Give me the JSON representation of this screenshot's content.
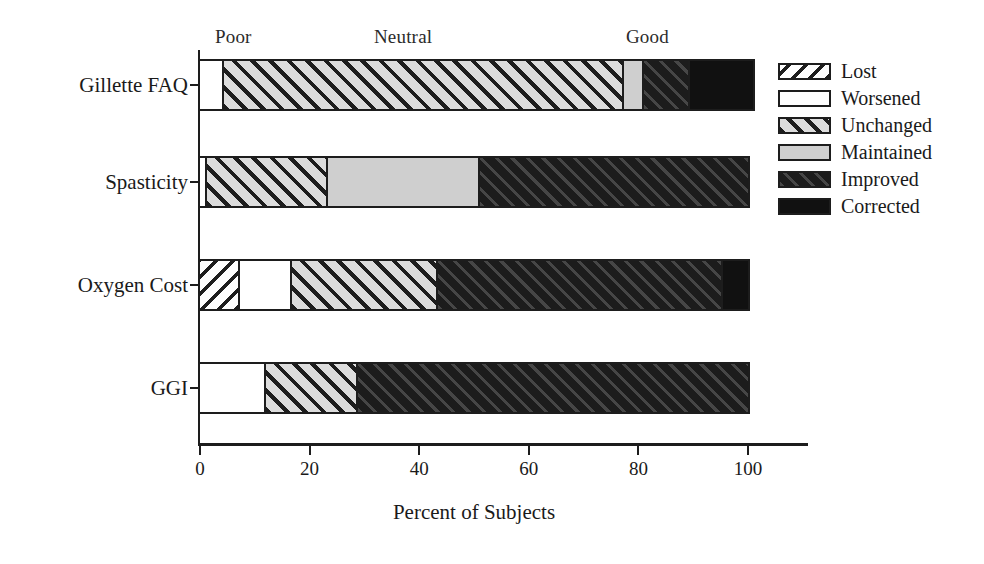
{
  "chart_data": {
    "type": "bar",
    "orientation": "horizontal",
    "stacked": true,
    "title": "",
    "xlabel": "Percent of Subjects",
    "ylabel": "",
    "xlim": [
      0,
      100
    ],
    "xticks": [
      0,
      20,
      40,
      60,
      80,
      100
    ],
    "xtick_labels": [
      "0",
      "20",
      "40",
      "60",
      "80",
      "100"
    ],
    "grid": false,
    "legend_position": "right",
    "categories": [
      "Gillette FAQ",
      "Spasticity",
      "Oxygen Cost",
      "GGI"
    ],
    "series": [
      {
        "name": "Lost",
        "values": [
          0,
          0,
          7,
          0
        ]
      },
      {
        "name": "Worsened",
        "values": [
          4,
          1,
          9.5,
          11.7
        ]
      },
      {
        "name": "Unchanged",
        "values": [
          73,
          22,
          26.5,
          16.8
        ]
      },
      {
        "name": "Maintained",
        "values": [
          3.7,
          27.7,
          0,
          0
        ]
      },
      {
        "name": "Improved",
        "values": [
          8.3,
          49.3,
          52,
          71.5
        ]
      },
      {
        "name": "Corrected",
        "values": [
          12,
          0,
          5,
          0
        ]
      }
    ],
    "annotations": [
      {
        "text": "Poor",
        "x_percent": 2,
        "position": "above-axis"
      },
      {
        "text": "Neutral",
        "x_percent": 31,
        "position": "above-axis"
      },
      {
        "text": "Good",
        "x_percent": 77,
        "position": "above-axis"
      }
    ]
  },
  "legend": {
    "items": [
      {
        "label": "Lost",
        "fill": "fill-lost"
      },
      {
        "label": "Worsened",
        "fill": "fill-worsened"
      },
      {
        "label": "Unchanged",
        "fill": "fill-unchanged"
      },
      {
        "label": "Maintained",
        "fill": "fill-maintained"
      },
      {
        "label": "Improved",
        "fill": "fill-improved"
      },
      {
        "label": "Corrected",
        "fill": "fill-corrected"
      }
    ]
  },
  "colors": {
    "axis": "#1d1d1d",
    "text": "#1a1a1a",
    "background": "#ffffff",
    "light_gray": "#cfcfcf",
    "dark": "#111111"
  }
}
